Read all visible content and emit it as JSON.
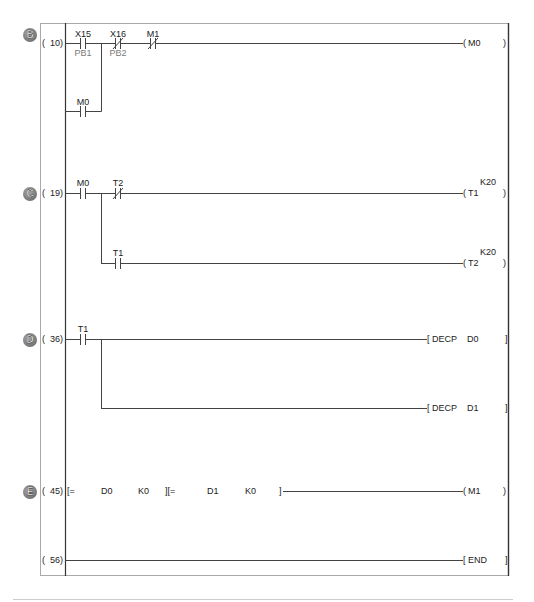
{
  "diagram": {
    "type": "ladder",
    "colors": {
      "wire": "#444444",
      "rail": "#333333",
      "frame": "#aaaaaa",
      "separator": "#cccccc",
      "comment": "#7a7a7a",
      "marker": "#6a6a6a"
    }
  },
  "rungs": [
    {
      "marker": "B",
      "step": {
        "open": "(",
        "num": "10)"
      },
      "contacts": [
        {
          "device": "X15",
          "comment": "PB1",
          "type": "NO"
        },
        {
          "device": "X16",
          "comment": "PB2",
          "type": "NC"
        },
        {
          "device": "M1",
          "type": "NC"
        }
      ],
      "branch": [
        {
          "device": "M0",
          "type": "NO"
        }
      ],
      "outputs": [
        {
          "open": "(",
          "device": "M0",
          "close": ")"
        }
      ]
    },
    {
      "marker": "C",
      "step": {
        "open": "(",
        "num": "19)"
      },
      "contacts": [
        {
          "device": "M0",
          "type": "NO"
        },
        {
          "device": "T2",
          "type": "NC"
        }
      ],
      "branch": [
        {
          "device": "T1",
          "type": "NO"
        }
      ],
      "outputs": [
        {
          "open": "(",
          "device": "T1",
          "setpoint": "K20",
          "close": ")"
        },
        {
          "open": "(",
          "device": "T2",
          "setpoint": "K20",
          "close": ")"
        }
      ]
    },
    {
      "marker": "D",
      "step": {
        "open": "(",
        "num": "36)"
      },
      "contacts": [
        {
          "device": "T1",
          "type": "NO"
        }
      ],
      "outputs": [
        {
          "open": "[",
          "instruction": "DECP",
          "operand": "D0",
          "close": "]"
        },
        {
          "open": "[",
          "instruction": "DECP",
          "operand": "D1",
          "close": "]"
        }
      ]
    },
    {
      "marker": "E",
      "step": {
        "open": "(",
        "num": "45)"
      },
      "compares": [
        {
          "open": "[=",
          "s1": "D0",
          "s2": "K0"
        },
        {
          "open": "][=",
          "s1": "D1",
          "s2": "K0",
          "close": "]"
        }
      ],
      "outputs": [
        {
          "open": "(",
          "device": "M1",
          "close": ")"
        }
      ]
    },
    {
      "step": {
        "open": "(",
        "num": "56)"
      },
      "outputs": [
        {
          "open": "[",
          "instruction": "END",
          "close": "]"
        }
      ]
    }
  ]
}
